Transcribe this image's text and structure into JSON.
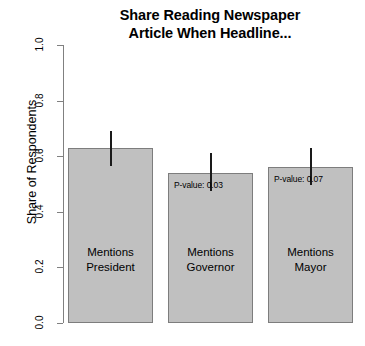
{
  "chart_data": {
    "type": "bar",
    "title": "Share Reading Newspaper Article When Headline...",
    "title_lines": [
      "Share Reading Newspaper",
      "Article When Headline..."
    ],
    "xlabel": "",
    "ylabel": "Share of Respondents",
    "ylim": [
      0.0,
      1.0
    ],
    "ytick_labels": [
      "1.0",
      "0.8",
      "0.6",
      "0.4",
      "0.2",
      "0.0"
    ],
    "ytick_values": [
      1.0,
      0.8,
      0.6,
      0.4,
      0.2,
      0.0
    ],
    "grid": false,
    "legend": "none",
    "categories": [
      "Mentions President",
      "Mentions Governor",
      "Mentions Mayor"
    ],
    "category_lines": [
      [
        "Mentions",
        "President"
      ],
      [
        "Mentions",
        "Governor"
      ],
      [
        "Mentions",
        "Mayor"
      ]
    ],
    "values": [
      0.63,
      0.54,
      0.56
    ],
    "error_high": [
      0.69,
      0.61,
      0.63
    ],
    "annotations": [
      {
        "category": "Mentions President",
        "text": ""
      },
      {
        "category": "Mentions Governor",
        "text": "P-value: 0.03"
      },
      {
        "category": "Mentions Mayor",
        "text": "P-value: 0.07"
      }
    ],
    "colors": {
      "bar_fill": "#c0c0c0",
      "bar_stroke": "#7d7d7d",
      "error_bar": "#1a1a1a",
      "axis": "#808080",
      "text": "#000000",
      "background": "#ffffff"
    }
  }
}
